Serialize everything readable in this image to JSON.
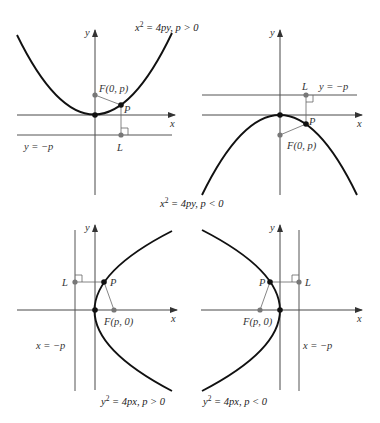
{
  "panels": [
    {
      "id": "top-left",
      "caption": {
        "lhs": "x",
        "sup": "2",
        "rhs": " = 4py, p > 0"
      },
      "labels": {
        "y": "y",
        "x": "x",
        "focus": "F(0, p)",
        "point": "P",
        "foot": "L",
        "directrix": "y = −p"
      }
    },
    {
      "id": "top-right",
      "caption": {
        "lhs": "x",
        "sup": "2",
        "rhs": " = 4py, p < 0"
      },
      "labels": {
        "y": "y",
        "x": "x",
        "focus": "F(0, p)",
        "point": "P",
        "foot": "L",
        "directrix": "y = −p"
      }
    },
    {
      "id": "bottom-left",
      "caption": {
        "lhs": "y",
        "sup": "2",
        "rhs": " = 4px, p > 0"
      },
      "labels": {
        "y": "y",
        "x": "x",
        "focus": "F(p, 0)",
        "point": "P",
        "foot": "L",
        "directrix": "x = −p"
      }
    },
    {
      "id": "bottom-right",
      "caption": {
        "lhs": "y",
        "sup": "2",
        "rhs": " = 4px, p < 0"
      },
      "labels": {
        "y": "y",
        "x": "x",
        "focus": "F(p, 0)",
        "point": "P",
        "foot": "L",
        "directrix": "x = −p"
      }
    }
  ],
  "colors": {
    "curve": "#111111",
    "axis": "#333333",
    "points_gray": "#777777",
    "points_black": "#111111"
  }
}
